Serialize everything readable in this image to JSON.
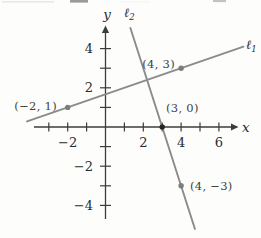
{
  "figure": {
    "background": "#fdfdfc",
    "axis_color": "#3c3c3c",
    "line_color": "#8b8b8b",
    "text_color": "#2b2b2b",
    "point_label_color": "#3f3f3f",
    "x_axis_end_label": "x",
    "y_axis_end_label": "y"
  },
  "chart_data": {
    "type": "line",
    "title": "",
    "xlabel": "x",
    "ylabel": "y",
    "xlim": [
      -4.6,
      7.6
    ],
    "ylim": [
      -5.5,
      5.4
    ],
    "grid": false,
    "x_ticks": [
      -3,
      -2,
      -1,
      1,
      2,
      3,
      4,
      5,
      6
    ],
    "y_ticks": [
      -4,
      -3,
      -2,
      -1,
      1,
      2,
      3,
      4
    ],
    "x_tick_labels": [
      {
        "value": -2,
        "text": "−2"
      },
      {
        "value": 2,
        "text": "2"
      },
      {
        "value": 4,
        "text": "4"
      },
      {
        "value": 6,
        "text": "6"
      }
    ],
    "y_tick_labels": [
      {
        "value": 4,
        "text": "4"
      },
      {
        "value": 2,
        "text": "2"
      },
      {
        "value": -2,
        "text": "−2"
      },
      {
        "value": -4,
        "text": "−4"
      }
    ],
    "series": [
      {
        "name": "l1",
        "label_main": "ℓ",
        "label_sub": "1",
        "points": [
          [
            -2,
            1
          ],
          [
            4,
            3
          ]
        ],
        "slope": 0.3333,
        "y_intercept": 1.6667,
        "draw_range": {
          "axis": "x",
          "from": -4.15,
          "to": 7.3
        }
      },
      {
        "name": "l2",
        "label_main": "ℓ",
        "label_sub": "2",
        "points": [
          [
            3,
            0
          ],
          [
            4,
            -3
          ]
        ],
        "slope": -3,
        "y_intercept": 9,
        "draw_range": {
          "axis": "y",
          "from": 5.05,
          "to": -5.2
        }
      }
    ],
    "labeled_points": [
      {
        "x": -2,
        "y": 1,
        "label": "(−2, 1)",
        "dot_color": "#7d7d7d"
      },
      {
        "x": 4,
        "y": 3,
        "label": "(4, 3)",
        "dot_color": "#7d7d7d"
      },
      {
        "x": 3,
        "y": 0,
        "label": "(3, 0)",
        "dot_color": "#262626"
      },
      {
        "x": 4,
        "y": -3,
        "label": "(4, −3)",
        "dot_color": "#7d7d7d"
      }
    ]
  }
}
